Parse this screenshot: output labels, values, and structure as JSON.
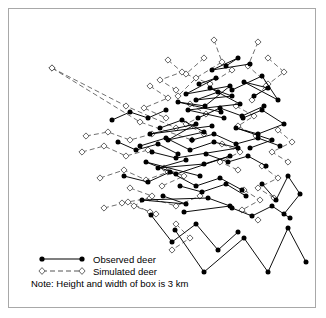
{
  "figure": {
    "title": "",
    "frame": {
      "border_color": "#a8a8a8",
      "background": "#ffffff"
    }
  },
  "legend": {
    "items": [
      {
        "label": "Observed deer",
        "marker": "filled-circle",
        "line": "solid",
        "color": "#000000"
      },
      {
        "label": "Simulated deer",
        "marker": "open-diamond",
        "line": "dashed",
        "color": "#555555"
      }
    ]
  },
  "note": {
    "text": "Note: Height and width of box is 3 km"
  },
  "chart_data": {
    "type": "scatter",
    "title": "",
    "xlabel": "",
    "ylabel": "",
    "xlim": [
      0,
      3
    ],
    "ylim": [
      0,
      3
    ],
    "grid": false,
    "legend_position": "bottom-left",
    "scale_note": "Height and width of box is 3 km",
    "series": [
      {
        "name": "Observed deer",
        "marker": "filled-circle",
        "line": "solid",
        "color": "#000000",
        "paths": [
          [
            [
              218,
              92
            ],
            [
              196,
              100
            ],
            [
              232,
              96
            ],
            [
              210,
              88
            ],
            [
              240,
              104
            ],
            [
              188,
              110
            ],
            [
              224,
              118
            ]
          ],
          [
            [
              199,
              84
            ],
            [
              216,
              78
            ],
            [
              186,
              94
            ],
            [
              230,
              86
            ],
            [
              205,
              106
            ],
            [
              178,
              102
            ],
            [
              221,
              112
            ]
          ],
          [
            [
              160,
              128
            ],
            [
              182,
              120
            ],
            [
              204,
              132
            ],
            [
              168,
              140
            ],
            [
              196,
              124
            ],
            [
              150,
              134
            ],
            [
              212,
              126
            ]
          ],
          [
            [
              140,
              146
            ],
            [
              166,
              138
            ],
            [
              190,
              150
            ],
            [
              214,
              142
            ],
            [
              238,
              148
            ],
            [
              176,
              158
            ],
            [
              152,
              152
            ]
          ],
          [
            [
              186,
              160
            ],
            [
              158,
              168
            ],
            [
              204,
              164
            ],
            [
              230,
              156
            ],
            [
              176,
              174
            ],
            [
              146,
              162
            ],
            [
              200,
              176
            ]
          ],
          [
            [
              243,
              118
            ],
            [
              262,
              110
            ],
            [
              284,
              124
            ],
            [
              258,
              134
            ],
            [
              236,
              128
            ],
            [
              272,
              140
            ],
            [
              250,
              148
            ]
          ],
          [
            [
              254,
              96
            ],
            [
              268,
              88
            ],
            [
              244,
              82
            ],
            [
              278,
              100
            ],
            [
              262,
              76
            ],
            [
              232,
              90
            ]
          ],
          [
            [
              124,
              176
            ],
            [
              148,
              182
            ],
            [
              170,
              172
            ],
            [
              196,
              186
            ],
            [
              220,
              178
            ],
            [
              242,
              190
            ]
          ],
          [
            [
              163,
              196
            ],
            [
              186,
              204
            ],
            [
              142,
              200
            ],
            [
              208,
              198
            ],
            [
              230,
              206
            ],
            [
              184,
              212
            ]
          ],
          [
            [
              175,
              230
            ],
            [
              204,
              272
            ],
            [
              244,
              238
            ],
            [
              268,
              272
            ],
            [
              288,
              228
            ],
            [
              306,
              262
            ]
          ],
          [
            [
              151,
              215
            ],
            [
              172,
              242
            ],
            [
              196,
              224
            ],
            [
              218,
              250
            ],
            [
              238,
              232
            ]
          ],
          [
            [
              262,
              184
            ],
            [
              276,
              200
            ],
            [
              288,
              176
            ],
            [
              300,
              194
            ],
            [
              284,
              214
            ]
          ],
          [
            [
              118,
              142
            ],
            [
              136,
              150
            ],
            [
              158,
              144
            ],
            [
              178,
              154
            ]
          ],
          [
            [
              226,
              66
            ],
            [
              238,
              58
            ],
            [
              212,
              70
            ],
            [
              250,
              64
            ]
          ],
          [
            [
              192,
              140
            ],
            [
              214,
              134
            ],
            [
              236,
              144
            ],
            [
              258,
              138
            ],
            [
              280,
              146
            ]
          ],
          [
            [
              166,
              110
            ],
            [
              148,
              118
            ],
            [
              130,
              112
            ],
            [
              112,
              120
            ]
          ],
          [
            [
              206,
              154
            ],
            [
              228,
              162
            ],
            [
              248,
              156
            ],
            [
              266,
              166
            ]
          ],
          [
            [
              180,
              186
            ],
            [
              202,
              192
            ],
            [
              226,
              184
            ],
            [
              246,
              196
            ]
          ],
          [
            [
              232,
              208
            ],
            [
              252,
              216
            ],
            [
              272,
              206
            ],
            [
              290,
              218
            ]
          ],
          [
            [
              198,
              118
            ],
            [
              220,
              108
            ],
            [
              242,
              116
            ],
            [
              264,
              106
            ]
          ]
        ]
      },
      {
        "name": "Simulated deer",
        "marker": "open-diamond",
        "line": "dashed",
        "color": "#555555",
        "paths": [
          [
            [
              52,
              68
            ],
            [
              126,
              106
            ],
            [
              176,
              128
            ]
          ],
          [
            [
              52,
              68
            ],
            [
              140,
              122
            ],
            [
              192,
              140
            ]
          ],
          [
            [
              214,
              40
            ],
            [
              222,
              62
            ],
            [
              196,
              78
            ],
            [
              178,
              96
            ]
          ],
          [
            [
              258,
              42
            ],
            [
              248,
              66
            ],
            [
              268,
              84
            ],
            [
              252,
              100
            ]
          ],
          [
            [
              204,
              58
            ],
            [
              186,
              74
            ],
            [
              210,
              84
            ],
            [
              232,
              70
            ]
          ],
          [
            [
              150,
              86
            ],
            [
              168,
              98
            ],
            [
              144,
              108
            ],
            [
              166,
              118
            ]
          ],
          [
            [
              86,
              136
            ],
            [
              108,
              132
            ],
            [
              130,
              140
            ],
            [
              152,
              134
            ]
          ],
          [
            [
              82,
              152
            ],
            [
              104,
              146
            ],
            [
              126,
              156
            ],
            [
              148,
              150
            ]
          ],
          [
            [
              122,
              203
            ],
            [
              150,
              198
            ],
            [
              176,
              206
            ],
            [
              200,
              196
            ]
          ],
          [
            [
              100,
              178
            ],
            [
              124,
              170
            ],
            [
              146,
              180
            ],
            [
              168,
              172
            ]
          ],
          [
            [
              278,
              130
            ],
            [
              292,
              142
            ],
            [
              272,
              152
            ],
            [
              288,
              162
            ]
          ],
          [
            [
              236,
              106
            ],
            [
              254,
              116
            ],
            [
              238,
              126
            ],
            [
              256,
              136
            ]
          ],
          [
            [
              168,
              60
            ],
            [
              182,
              72
            ],
            [
              160,
              80
            ],
            [
              176,
              90
            ]
          ],
          [
            [
              262,
              166
            ],
            [
              278,
              178
            ],
            [
              258,
              188
            ],
            [
              274,
              198
            ]
          ],
          [
            [
              130,
              188
            ],
            [
              152,
              196
            ],
            [
              134,
              206
            ],
            [
              156,
              214
            ]
          ],
          [
            [
              190,
              104
            ],
            [
              206,
              114
            ],
            [
              186,
              124
            ],
            [
              204,
              134
            ]
          ],
          [
            [
              222,
              144
            ],
            [
              240,
              152
            ],
            [
              220,
              162
            ],
            [
              238,
              170
            ]
          ],
          [
            [
              104,
              208
            ],
            [
              128,
              202
            ],
            [
              150,
              212
            ]
          ],
          [
            [
              164,
              168
            ],
            [
              184,
              176
            ],
            [
              162,
              186
            ]
          ],
          [
            [
              244,
              190
            ],
            [
              260,
              200
            ],
            [
              242,
              210
            ],
            [
              258,
              220
            ]
          ],
          [
            [
              176,
              224
            ],
            [
              190,
              238
            ],
            [
              172,
              250
            ]
          ],
          [
            [
              268,
              58
            ],
            [
              284,
              72
            ],
            [
              266,
              86
            ]
          ]
        ]
      }
    ]
  }
}
